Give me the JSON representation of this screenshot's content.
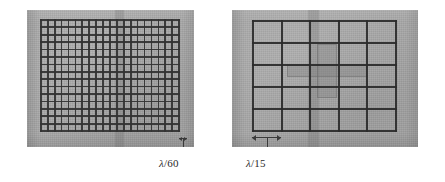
{
  "figure": {
    "type": "photograph-pair",
    "background_color": "#ffffff",
    "panel_color": "#a8a8a8",
    "mesh_color": "#2e2e2e",
    "label_color": "#2a2a2a"
  },
  "panels": [
    {
      "id": "fine-mesh-panel",
      "name": "left-panel",
      "x": 27,
      "y": 10,
      "width": 167,
      "height": 137,
      "screen": {
        "name": "fine-mesh-screen",
        "x": 13,
        "y": 9,
        "width": 140,
        "height": 113,
        "columns": 20,
        "rows": 15,
        "line_width": 1.7,
        "cell_pitch_label": "λ/60"
      },
      "feedline": {
        "x": 88,
        "y": 0,
        "width": 9,
        "height": 137
      },
      "dimension": {
        "name": "lambda-over-60-dimension",
        "x": 152,
        "y": 128,
        "width": 8,
        "style": "tick",
        "stem_height": 9
      },
      "label": {
        "name": "lambda-over-60-label",
        "lambda": "λ",
        "divisor": "/60",
        "text": "λ/60",
        "x": 159,
        "y": 157
      }
    },
    {
      "id": "coarse-mesh-panel",
      "name": "right-panel",
      "x": 232,
      "y": 10,
      "width": 186,
      "height": 137,
      "screen": {
        "name": "coarse-mesh-screen",
        "x": 20,
        "y": 10,
        "width": 145,
        "height": 112,
        "columns": 5,
        "rows": 5,
        "line_width": 2.1,
        "cell_pitch_label": "λ/15"
      },
      "feedline": {
        "x": 76,
        "y": 0,
        "width": 11,
        "height": 137
      },
      "cross_element": {
        "name": "cross-dipole-element",
        "x": 55,
        "y": 34,
        "width": 80,
        "height": 54
      },
      "dimension": {
        "name": "lambda-over-15-dimension",
        "x": 20,
        "y": 127,
        "width": 29,
        "style": "double-arrow",
        "stem_height": 10
      },
      "label": {
        "name": "lambda-over-15-label",
        "lambda": "λ",
        "divisor": "/15",
        "text": "λ/15",
        "x": 246,
        "y": 157
      }
    }
  ]
}
